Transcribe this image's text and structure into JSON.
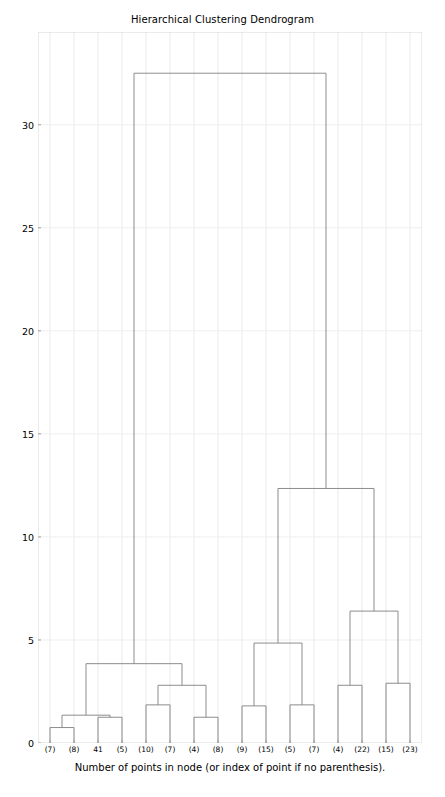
{
  "chart_data": {
    "type": "dendrogram",
    "title": "Hierarchical Clustering Dendrogram",
    "xlabel": "Number of points in node (or index of point if no parenthesis).",
    "ylabel": "",
    "grid": true,
    "legend": null,
    "ylim": [
      0,
      34.5
    ],
    "yticks": [
      0,
      5,
      10,
      15,
      20,
      25,
      30
    ],
    "ytick_labels": [
      "0",
      "5",
      "10",
      "15",
      "20",
      "25",
      "30"
    ],
    "leaf_labels": [
      "(7)",
      "(8)",
      "41",
      "(5)",
      "(10)",
      "(7)",
      "(4)",
      "(8)",
      "(9)",
      "(15)",
      "(5)",
      "(7)",
      "(4)",
      "(22)",
      "(15)",
      "(23)"
    ],
    "leaf_positions": [
      1,
      2,
      3,
      4,
      5,
      6,
      7,
      8,
      9,
      10,
      11,
      12,
      13,
      14,
      15,
      16
    ],
    "line_color": "#808080",
    "merges": [
      {
        "id": "m1",
        "left": {
          "type": "leaf",
          "pos": 1
        },
        "right": {
          "type": "leaf",
          "pos": 2
        },
        "height": 0.75
      },
      {
        "id": "m2",
        "left": {
          "type": "leaf",
          "pos": 3
        },
        "right": {
          "type": "leaf",
          "pos": 4
        },
        "height": 1.25
      },
      {
        "id": "m3",
        "left": {
          "type": "node",
          "ref": "m1"
        },
        "right": {
          "type": "node",
          "ref": "m2"
        },
        "height": 1.35
      },
      {
        "id": "m4",
        "left": {
          "type": "leaf",
          "pos": 5
        },
        "right": {
          "type": "leaf",
          "pos": 6
        },
        "height": 1.85
      },
      {
        "id": "m5",
        "left": {
          "type": "leaf",
          "pos": 7
        },
        "right": {
          "type": "leaf",
          "pos": 8
        },
        "height": 1.25
      },
      {
        "id": "m6",
        "left": {
          "type": "node",
          "ref": "m4"
        },
        "right": {
          "type": "node",
          "ref": "m5"
        },
        "height": 2.8
      },
      {
        "id": "m7",
        "left": {
          "type": "node",
          "ref": "m3"
        },
        "right": {
          "type": "node",
          "ref": "m6"
        },
        "height": 3.85
      },
      {
        "id": "m8",
        "left": {
          "type": "leaf",
          "pos": 9
        },
        "right": {
          "type": "leaf",
          "pos": 10
        },
        "height": 1.8
      },
      {
        "id": "m9",
        "left": {
          "type": "leaf",
          "pos": 11
        },
        "right": {
          "type": "leaf",
          "pos": 12
        },
        "height": 1.85
      },
      {
        "id": "m10",
        "left": {
          "type": "node",
          "ref": "m8"
        },
        "right": {
          "type": "node",
          "ref": "m9"
        },
        "height": 4.85
      },
      {
        "id": "m11",
        "left": {
          "type": "leaf",
          "pos": 13
        },
        "right": {
          "type": "leaf",
          "pos": 14
        },
        "height": 2.8
      },
      {
        "id": "m12",
        "left": {
          "type": "leaf",
          "pos": 15
        },
        "right": {
          "type": "leaf",
          "pos": 16
        },
        "height": 2.9
      },
      {
        "id": "m13",
        "left": {
          "type": "node",
          "ref": "m11"
        },
        "right": {
          "type": "node",
          "ref": "m12"
        },
        "height": 6.4
      },
      {
        "id": "m14",
        "left": {
          "type": "node",
          "ref": "m10"
        },
        "right": {
          "type": "node",
          "ref": "m13"
        },
        "height": 12.35
      },
      {
        "id": "m15",
        "left": {
          "type": "node",
          "ref": "m7"
        },
        "right": {
          "type": "node",
          "ref": "m14"
        },
        "height": 32.5
      }
    ]
  }
}
